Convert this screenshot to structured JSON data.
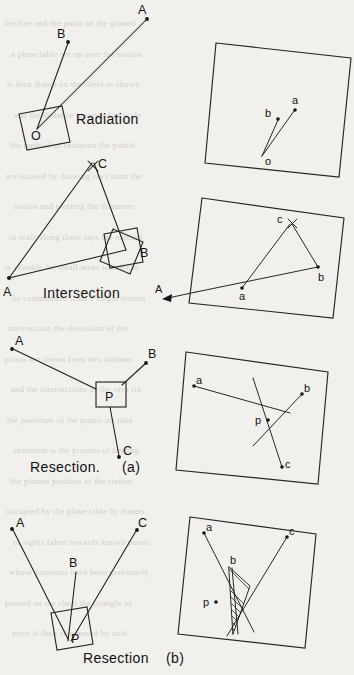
{
  "page": {
    "width": 354,
    "height": 675,
    "background_color": "#f2f0ec",
    "ink_color": "#1b1b1b"
  },
  "figures": [
    {
      "id": "radiation",
      "caption": "Radiation",
      "ground_station_label": "O",
      "ground_point_labels": [
        "A",
        "B"
      ],
      "sheet_station_label": "o",
      "sheet_point_labels": [
        "a",
        "b"
      ]
    },
    {
      "id": "intersection",
      "caption": "Intersection",
      "ground_station_labels": [
        "A",
        "B"
      ],
      "ground_point_labels": [
        "C"
      ],
      "sheet_station_labels": [
        "a",
        "b"
      ],
      "sheet_point_labels": [
        "c"
      ],
      "arrow_label": "A"
    },
    {
      "id": "resection_a",
      "caption": "Resection.",
      "sub_caption": "(a)",
      "ground_station_label": "P",
      "ground_point_labels": [
        "A",
        "B",
        "C"
      ],
      "sheet_station_label": "p",
      "sheet_point_labels": [
        "a",
        "b",
        "c"
      ]
    },
    {
      "id": "resection_b",
      "caption": "Resection",
      "sub_caption": "(b)",
      "ground_station_label": "P",
      "ground_point_labels": [
        "A",
        "B",
        "C"
      ],
      "sheet_station_label": "p",
      "sheet_point_labels": [
        "a",
        "b",
        "c"
      ],
      "annotation": "triangle of error (hatched)"
    }
  ],
  "labels": {
    "A": "A",
    "B": "B",
    "C": "C",
    "O": "O",
    "P": "P",
    "a": "a",
    "b": "b",
    "c": "c",
    "o": "o",
    "p": "p"
  },
  "captions": {
    "radiation": "Radiation",
    "intersection": "Intersection",
    "resection_a": "Resection.",
    "resection_a_sub": "(a)",
    "resection_b": "Resection",
    "resection_b_sub": "(b)"
  },
  "ghost_text": [
    "the line and the point on the ground",
    "a plane table set up over the station",
    "is then drawn on the sheet as shown",
    "and the distance measured to scale",
    "the method of radiation the points",
    "are located by drawing rays from the",
    "station and plotting the distances",
    "to scale along these rays the method",
    "is suitable for small areas which can",
    "be commanded from a single station",
    "intersection the directions of the",
    "points are drawn from two stations",
    "and the intersections of the rays fix",
    "the positions of the points on plan",
    "resection is the process of finding",
    "the plotted position of the station",
    "occupied by the plane table by means",
    "of sights taken towards known points",
    "whose locations have been previously",
    "plotted on the sheet the triangle of",
    "error is then eliminated by trial"
  ]
}
